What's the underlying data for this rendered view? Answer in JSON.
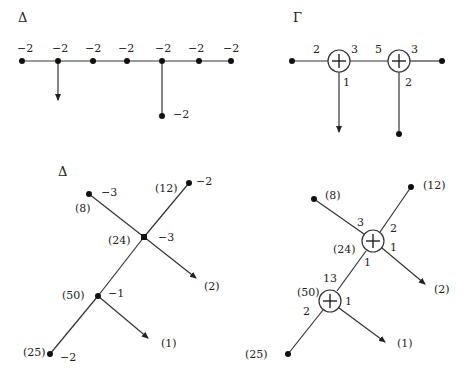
{
  "colors": {
    "ink": "#222222",
    "background": "#ffffff"
  },
  "panel_top_left": {
    "title": "Δ",
    "chain_weights": [
      "−2",
      "−2",
      "−2",
      "−2",
      "−2",
      "−2",
      "−2"
    ],
    "branch_weight": "−2"
  },
  "panel_top_right": {
    "title": "Γ",
    "circle1": {
      "left": "2",
      "right": "3",
      "bottom": "1"
    },
    "circle2": {
      "left": "5",
      "right": "3",
      "bottom": "2"
    }
  },
  "panel_bottom_left": {
    "title": "Δ",
    "nodes": {
      "n8": {
        "mult": "(8)",
        "weight": "−3"
      },
      "n12": {
        "mult": "(12)",
        "weight": "−2"
      },
      "n24": {
        "mult": "(24)",
        "weight": "−3"
      },
      "n50": {
        "mult": "(50)",
        "weight": "−1"
      },
      "n25": {
        "mult": "(25)",
        "weight": "−2"
      }
    },
    "arrows": {
      "a2": "(2)",
      "a1": "(1)"
    }
  },
  "panel_bottom_right": {
    "labels": {
      "n8": "(8)",
      "n12": "(12)",
      "n24": "(24)",
      "n50": "(50)",
      "n25": "(25)",
      "a2": "(2)",
      "a1": "(1)"
    },
    "upper_circle": {
      "top_left": "3",
      "top_right": "2",
      "right": "1",
      "bottom": "1"
    },
    "lower_circle": {
      "top": "13",
      "left": "2",
      "right": "1"
    }
  }
}
